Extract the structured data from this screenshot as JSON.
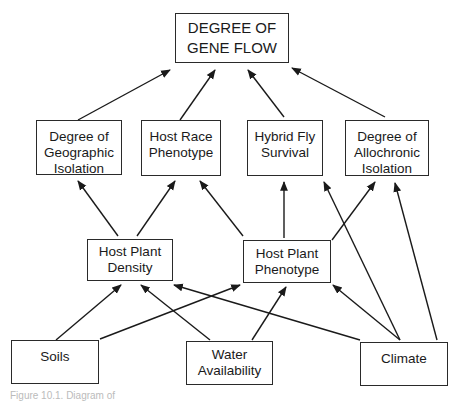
{
  "diagram": {
    "nodes": [
      {
        "id": "gene_flow",
        "label": "DEGREE OF\nGENE FLOW",
        "x": 175,
        "y": 13,
        "w": 114,
        "h": 50
      },
      {
        "id": "geo_isolation",
        "label": "Degree of\nGeographic\nIsolation",
        "x": 36,
        "y": 120,
        "w": 86,
        "h": 55
      },
      {
        "id": "host_race",
        "label": "Host Race\nPhenotype",
        "x": 141,
        "y": 120,
        "w": 80,
        "h": 56
      },
      {
        "id": "hybrid_survival",
        "label": "Hybrid Fly\nSurvival",
        "x": 247,
        "y": 120,
        "w": 76,
        "h": 56
      },
      {
        "id": "allochronic",
        "label": "Degree of\nAllochronic\nIsolation",
        "x": 345,
        "y": 120,
        "w": 84,
        "h": 56
      },
      {
        "id": "plant_density",
        "label": "Host Plant\nDensity",
        "x": 87,
        "y": 239,
        "w": 86,
        "h": 42
      },
      {
        "id": "plant_phenotype",
        "label": "Host Plant\nPhenotype",
        "x": 243,
        "y": 240,
        "w": 88,
        "h": 43
      },
      {
        "id": "soils",
        "label": "Soils",
        "x": 11,
        "y": 340,
        "w": 88,
        "h": 44
      },
      {
        "id": "water",
        "label": "Water\nAvailability",
        "x": 186,
        "y": 341,
        "w": 87,
        "h": 44
      },
      {
        "id": "climate",
        "label": "Climate",
        "x": 360,
        "y": 342,
        "w": 88,
        "h": 44
      }
    ],
    "edges": [
      {
        "from": "geo_isolation",
        "to": "gene_flow",
        "x1": 78,
        "y1": 120,
        "x2": 170,
        "y2": 70
      },
      {
        "from": "host_race",
        "to": "gene_flow",
        "x1": 180,
        "y1": 120,
        "x2": 215,
        "y2": 70
      },
      {
        "from": "hybrid_survival",
        "to": "gene_flow",
        "x1": 284,
        "y1": 117,
        "x2": 248,
        "y2": 70
      },
      {
        "from": "allochronic",
        "to": "gene_flow",
        "x1": 385,
        "y1": 117,
        "x2": 292,
        "y2": 68
      },
      {
        "from": "plant_density",
        "to": "geo_isolation",
        "x1": 118,
        "y1": 236,
        "x2": 78,
        "y2": 181
      },
      {
        "from": "plant_density",
        "to": "host_race",
        "x1": 137,
        "y1": 236,
        "x2": 175,
        "y2": 181
      },
      {
        "from": "plant_phenotype",
        "to": "host_race",
        "x1": 243,
        "y1": 236,
        "x2": 200,
        "y2": 181
      },
      {
        "from": "plant_phenotype",
        "to": "hybrid_survival",
        "x1": 284,
        "y1": 238,
        "x2": 284,
        "y2": 182
      },
      {
        "from": "climate",
        "to": "hybrid_survival",
        "x1": 400,
        "y1": 340,
        "x2": 324,
        "y2": 182
      },
      {
        "from": "plant_phenotype",
        "to": "allochronic",
        "x1": 332,
        "y1": 240,
        "x2": 375,
        "y2": 182
      },
      {
        "from": "climate",
        "to": "allochronic",
        "x1": 437,
        "y1": 340,
        "x2": 395,
        "y2": 183
      },
      {
        "from": "soils",
        "to": "plant_density",
        "x1": 56,
        "y1": 340,
        "x2": 121,
        "y2": 285
      },
      {
        "from": "water",
        "to": "plant_density",
        "x1": 210,
        "y1": 340,
        "x2": 141,
        "y2": 285
      },
      {
        "from": "climate",
        "to": "plant_density",
        "x1": 360,
        "y1": 340,
        "x2": 174,
        "y2": 285
      },
      {
        "from": "soils",
        "to": "plant_phenotype",
        "x1": 100,
        "y1": 339,
        "x2": 240,
        "y2": 285
      },
      {
        "from": "water",
        "to": "plant_phenotype",
        "x1": 252,
        "y1": 340,
        "x2": 286,
        "y2": 287
      },
      {
        "from": "climate",
        "to": "plant_phenotype",
        "x1": 400,
        "y1": 340,
        "x2": 333,
        "y2": 285
      }
    ],
    "caption": "Figure 10.1. Diagram of"
  }
}
